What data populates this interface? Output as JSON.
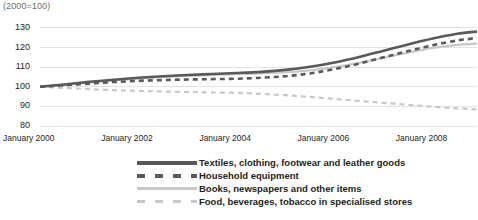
{
  "caption": "(2000=100)",
  "legend": {
    "items": [
      {
        "label": "Textiles, clothing, footwear and leather goods",
        "style": "solid-dark",
        "color": "#58595b"
      },
      {
        "label": "Household equipment",
        "style": "dash-dark",
        "color": "#58595b"
      },
      {
        "label": "Books, newspapers and other items",
        "style": "solid-light",
        "color": "#c7c8ca"
      },
      {
        "label": "Food, beverages, tobacco in specialised stores",
        "style": "dash-light",
        "color": "#c7c8ca"
      }
    ]
  },
  "axis": {
    "y_ticks": [
      "130",
      "120",
      "110",
      "100",
      "90",
      "80"
    ],
    "x_ticks": [
      "January  2000",
      "January  2002",
      "January  2004",
      "January  2006",
      "January  2008"
    ]
  },
  "chart_data": {
    "type": "line",
    "title": "",
    "subtitle": "(2000=100)",
    "xlabel": "",
    "ylabel": "",
    "ylim": [
      80,
      132
    ],
    "xlim": [
      2000.0,
      2008.9
    ],
    "grid": true,
    "legend_position": "bottom",
    "x": [
      2000.0,
      2000.5,
      2001.0,
      2001.5,
      2002.0,
      2002.5,
      2003.0,
      2003.5,
      2004.0,
      2004.5,
      2005.0,
      2005.5,
      2006.0,
      2006.5,
      2007.0,
      2007.5,
      2008.0,
      2008.5,
      2008.9
    ],
    "x_tick_values": [
      2000,
      2002,
      2004,
      2006,
      2008
    ],
    "series": [
      {
        "name": "Textiles, clothing, footwear and leather goods",
        "color": "#58595b",
        "style": "solid",
        "width": 2.6,
        "values": [
          100.0,
          101.2,
          102.5,
          103.6,
          104.6,
          105.4,
          106.0,
          106.5,
          107.0,
          107.6,
          108.6,
          110.2,
          112.4,
          115.2,
          118.4,
          121.6,
          124.6,
          127.0,
          128.2
        ]
      },
      {
        "name": "Household equipment",
        "color": "#58595b",
        "style": "dashed",
        "width": 2.6,
        "values": [
          100.0,
          100.8,
          101.6,
          102.4,
          103.0,
          103.4,
          103.7,
          103.9,
          104.1,
          104.6,
          105.4,
          106.8,
          109.0,
          111.8,
          115.0,
          118.2,
          121.2,
          123.6,
          124.8
        ]
      },
      {
        "name": "Books, newspapers and other items",
        "color": "#c7c8ca",
        "style": "solid",
        "width": 2.2,
        "values": [
          100.0,
          101.0,
          102.2,
          103.2,
          104.2,
          105.0,
          105.6,
          106.0,
          106.4,
          106.8,
          107.4,
          108.4,
          110.0,
          112.2,
          114.8,
          117.4,
          119.8,
          121.4,
          122.0
        ]
      },
      {
        "name": "Food, beverages, tobacco in specialised stores",
        "color": "#c7c8ca",
        "style": "dashed",
        "width": 2.2,
        "values": [
          100.0,
          99.4,
          98.8,
          98.3,
          97.9,
          97.6,
          97.3,
          97.1,
          96.9,
          96.4,
          95.7,
          94.8,
          93.8,
          92.8,
          91.8,
          90.8,
          89.8,
          89.0,
          88.5
        ]
      }
    ]
  }
}
